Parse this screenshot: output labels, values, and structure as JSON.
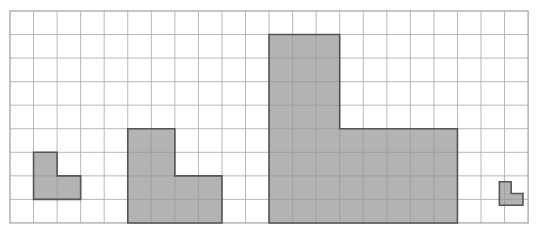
{
  "figure": {
    "grid": {
      "columns": 22,
      "rows": 9,
      "cell_size": 23.55,
      "origin_x": 10,
      "origin_y": 11,
      "line_color": "#b0b0b0",
      "outer_border_color": "#a0a0a0",
      "background_color": "#ffffff",
      "show_grid": true
    },
    "style": {
      "shape_fill": "#b3b3b3",
      "shape_stroke": "#555555",
      "shape_stroke_width": 1.6,
      "inner_grid_color": "#9a9a9a"
    },
    "shapes": [
      {
        "name": "shape-small-left",
        "label": "L-shape scale 1",
        "scale_units": 1,
        "origin_col": 1,
        "origin_row": 6,
        "width_units": 2,
        "height_units": 2,
        "area_units": 3,
        "points_units": [
          [
            0,
            0
          ],
          [
            1,
            0
          ],
          [
            1,
            1
          ],
          [
            2,
            1
          ],
          [
            2,
            2
          ],
          [
            0,
            2
          ]
        ]
      },
      {
        "name": "shape-medium",
        "label": "L-shape scale 2",
        "scale_units": 2,
        "origin_col": 5,
        "origin_row": 5,
        "width_units": 4,
        "height_units": 4,
        "area_units": 12,
        "points_units": [
          [
            0,
            0
          ],
          [
            2,
            0
          ],
          [
            2,
            2
          ],
          [
            4,
            2
          ],
          [
            4,
            4
          ],
          [
            0,
            4
          ]
        ]
      },
      {
        "name": "shape-large",
        "label": "L-shape scale 4",
        "scale_units": 4,
        "origin_col": 11,
        "origin_row": 1,
        "width_units": 8,
        "height_units": 8,
        "area_units": 48,
        "points_units": [
          [
            0,
            0
          ],
          [
            3,
            0
          ],
          [
            3,
            4
          ],
          [
            8,
            4
          ],
          [
            8,
            8
          ],
          [
            0,
            8
          ]
        ]
      },
      {
        "name": "shape-tiny-right",
        "label": "L-shape scale half",
        "scale_units": 0.5,
        "origin_col": 20.78,
        "origin_row": 7.25,
        "width_units": 1,
        "height_units": 1,
        "area_units": 0.75,
        "points_units": [
          [
            0,
            0
          ],
          [
            0.5,
            0
          ],
          [
            0.5,
            0.5
          ],
          [
            1,
            0.5
          ],
          [
            1,
            1
          ],
          [
            0,
            1
          ]
        ]
      }
    ]
  }
}
